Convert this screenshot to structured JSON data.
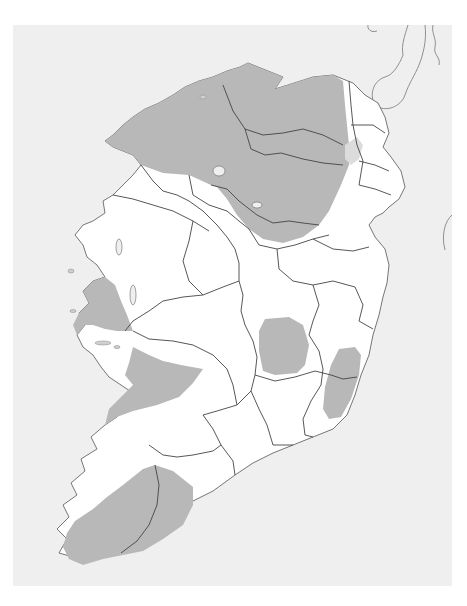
{
  "map": {
    "subject": "Ireland",
    "colors": {
      "sea": "#efefef",
      "land": "#ffffff",
      "shaded_region": "#b8b8b8",
      "light_shaded": "#dcdcdc",
      "county_border": "#555555",
      "coast": "#666666"
    },
    "shaded_regions": [
      {
        "name": "north-west-and-north-region",
        "area": "Donegal, Tyrone, Fermanagh, Derry, Leitrim, Cavan, Monaghan"
      },
      {
        "name": "west-galway-region",
        "area": "Connemara / West Galway"
      },
      {
        "name": "clare-region",
        "area": "Clare"
      },
      {
        "name": "midlands-region",
        "area": "Laois / Offaly"
      },
      {
        "name": "south-east-region",
        "area": "Wicklow / Carlow"
      },
      {
        "name": "south-west-region",
        "area": "Kerry / West Cork"
      }
    ]
  },
  "caption": {
    "text": ""
  }
}
